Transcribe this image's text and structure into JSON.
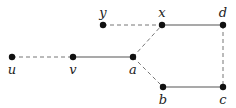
{
  "diagram": {
    "type": "graph",
    "colors": {
      "node": "#111111",
      "solid_edge": "#555555",
      "dashed_edge": "#777777",
      "label": "#222222"
    },
    "nodes": [
      {
        "id": "u",
        "label": "u",
        "x": 12,
        "y": 57,
        "label_pos": "below"
      },
      {
        "id": "v",
        "label": "v",
        "x": 73,
        "y": 57,
        "label_pos": "below"
      },
      {
        "id": "a",
        "label": "a",
        "x": 133,
        "y": 57,
        "label_pos": "below"
      },
      {
        "id": "y",
        "label": "y",
        "x": 103,
        "y": 25,
        "label_pos": "above"
      },
      {
        "id": "x",
        "label": "x",
        "x": 162,
        "y": 25,
        "label_pos": "above"
      },
      {
        "id": "d",
        "label": "d",
        "x": 223,
        "y": 25,
        "label_pos": "above"
      },
      {
        "id": "b",
        "label": "b",
        "x": 163,
        "y": 87,
        "label_pos": "below"
      },
      {
        "id": "c",
        "label": "c",
        "x": 223,
        "y": 87,
        "label_pos": "below"
      }
    ],
    "edges": [
      {
        "from": "u",
        "to": "v",
        "style": "dashed"
      },
      {
        "from": "v",
        "to": "a",
        "style": "solid"
      },
      {
        "from": "a",
        "to": "x",
        "style": "dashed"
      },
      {
        "from": "a",
        "to": "b",
        "style": "dashed"
      },
      {
        "from": "y",
        "to": "x",
        "style": "dashed"
      },
      {
        "from": "x",
        "to": "d",
        "style": "solid"
      },
      {
        "from": "d",
        "to": "c",
        "style": "dashed"
      },
      {
        "from": "b",
        "to": "c",
        "style": "solid"
      }
    ]
  }
}
